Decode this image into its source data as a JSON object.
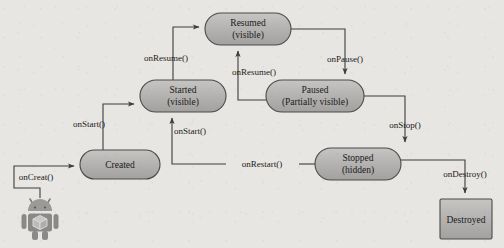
{
  "diagram": {
    "type": "state-diagram",
    "background_color": "#e8e6e2",
    "node_fill_color": "#b3b3b3",
    "node_stroke_color": "#4a4a4a",
    "edge_color": "#3d3d3d",
    "text_color": "#1a1a1a",
    "nodes": [
      {
        "id": "resumed",
        "label_line1": "Resumed",
        "label_line2": "(visible)",
        "shape": "rounded",
        "x": 205,
        "y": 13,
        "w": 86,
        "h": 32
      },
      {
        "id": "started",
        "label_line1": "Started",
        "label_line2": "(visible)",
        "shape": "rounded",
        "x": 140,
        "y": 80,
        "w": 86,
        "h": 32
      },
      {
        "id": "paused",
        "label_line1": "Paused",
        "label_line2": "(Partially visible)",
        "shape": "rounded",
        "x": 266,
        "y": 80,
        "w": 98,
        "h": 32
      },
      {
        "id": "created",
        "label_line1": "Created",
        "label_line2": "",
        "shape": "rounded",
        "x": 80,
        "y": 150,
        "w": 80,
        "h": 29
      },
      {
        "id": "stopped",
        "label_line1": "Stopped",
        "label_line2": "(hidden)",
        "shape": "rounded",
        "x": 315,
        "y": 148,
        "w": 86,
        "h": 32
      },
      {
        "id": "destroyed",
        "label_line1": "Destroyed",
        "label_line2": "",
        "shape": "rectangle",
        "x": 440,
        "y": 199,
        "w": 52,
        "h": 40
      }
    ],
    "edges": [
      {
        "id": "oncreate",
        "label": "onCreat()",
        "from": "launcher",
        "to": "created",
        "label_x": 36,
        "label_y": 177
      },
      {
        "id": "onstart",
        "label": "onStart()",
        "from": "created",
        "to": "started",
        "label_x": 89,
        "label_y": 124
      },
      {
        "id": "onresume",
        "label": "onResume()",
        "from": "started",
        "to": "resumed",
        "label_x": 166,
        "label_y": 58
      },
      {
        "id": "onpause",
        "label": "onPause()",
        "from": "resumed",
        "to": "paused",
        "label_x": 345,
        "label_y": 59
      },
      {
        "id": "onresume2",
        "label": "onResume()",
        "from": "paused",
        "to": "resumed",
        "label_x": 254,
        "label_y": 72
      },
      {
        "id": "onstop",
        "label": "onStop()",
        "from": "paused",
        "to": "stopped",
        "label_x": 405,
        "label_y": 125
      },
      {
        "id": "onrestart",
        "label": "onRestart()",
        "from": "stopped",
        "to": "started",
        "label_x": 262,
        "label_y": 161
      },
      {
        "id": "onstart2",
        "label": "onStart()",
        "from": "restart",
        "to": "started",
        "label_x": 190,
        "label_y": 131
      },
      {
        "id": "ondestroy",
        "label": "onDestroy()",
        "from": "stopped",
        "to": "destroyed",
        "label_x": 465,
        "label_y": 174
      }
    ],
    "launcher_icon": {
      "name": "android-robot-icon",
      "x": 23,
      "y": 198,
      "w": 34,
      "h": 44
    }
  }
}
